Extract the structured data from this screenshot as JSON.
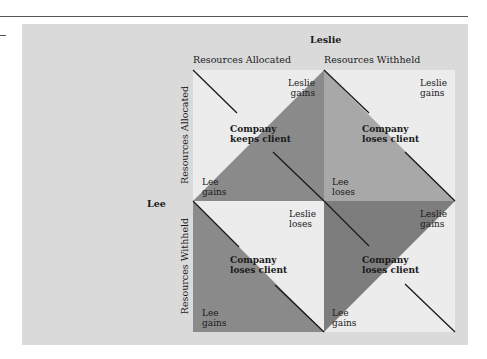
{
  "title_player_top": "Leslie",
  "title_player_left": "Lee",
  "columns": [
    "Resources Allocated",
    "Resources Withheld"
  ],
  "rows": [
    "Resources Allocated",
    "Resources Withheld"
  ],
  "cells": [
    {
      "position": "allocated-allocated",
      "leslie": "Leslie\ngains",
      "outcome_line1": "Company",
      "outcome_line2": "keeps client",
      "lee": "Lee\ngains",
      "leslie_l1": "Leslie",
      "leslie_l2": "gains",
      "lee_l1": "Lee",
      "lee_l2": "gains"
    },
    {
      "position": "allocated-withheld",
      "leslie_l1": "Leslie",
      "leslie_l2": "gains",
      "outcome_line1": "Company",
      "outcome_line2": "loses client",
      "lee_l1": "Lee",
      "lee_l2": "loses"
    },
    {
      "position": "withheld-allocated",
      "leslie_l1": "Leslie",
      "leslie_l2": "loses",
      "outcome_line1": "Company",
      "outcome_line2": "loses client",
      "lee_l1": "Lee",
      "lee_l2": "gains"
    },
    {
      "position": "withheld-withheld",
      "leslie_l1": "Leslie",
      "leslie_l2": "gains",
      "outcome_line1": "Company",
      "outcome_line2": "loses client",
      "lee_l1": "Lee",
      "lee_l2": "gains"
    }
  ],
  "colors": {
    "panel": "#dadada",
    "light": "#ececec",
    "mid": "#a8a8a8",
    "dark": "#8a8a8a",
    "darker": "#7d7d7d",
    "line": "#1a1a1a"
  }
}
